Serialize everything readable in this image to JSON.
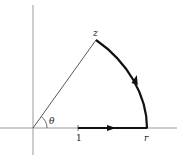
{
  "diagram": {
    "type": "complex-plane-contour",
    "labels": {
      "z": "z",
      "theta": "θ",
      "one": "1",
      "r": "r"
    },
    "elements": {
      "axes": [
        "horizontal-axis",
        "vertical-axis"
      ],
      "ray": "line from origin to z",
      "path": [
        "segment from 1 to r along real axis (arrow right)",
        "arc from r to z (arrow counterclockwise)"
      ],
      "angle": "θ arc at origin"
    },
    "colors": {
      "axis": "#888888",
      "line": "#333333",
      "path": "#111111",
      "background": "#ffffff"
    }
  }
}
